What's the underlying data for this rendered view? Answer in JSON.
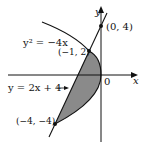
{
  "figure": {
    "axes": {
      "x_label": "x",
      "y_label": "y",
      "origin_label": "0"
    },
    "curves": [
      {
        "name": "parabola",
        "equation": "y² = −4x",
        "label_text": "y² = −4x"
      },
      {
        "name": "line",
        "equation": "y = 2x + 4",
        "label_text": "y = 2x + 4"
      }
    ],
    "points": [
      {
        "label": "(0, 4)",
        "x": 0,
        "y": 4
      },
      {
        "label": "(−1, 2)",
        "x": -1,
        "y": 2
      },
      {
        "label": "(−4, −4)",
        "x": -4,
        "y": -4
      }
    ],
    "shaded_region": "region between y² = −4x and y = 2x + 4",
    "colors": {
      "shade": "#8a8a8a",
      "stroke": "#111111"
    }
  }
}
